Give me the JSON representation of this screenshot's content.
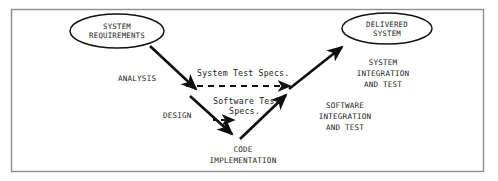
{
  "diagram": {
    "type": "v-model-process-diagram",
    "frame_color": "#8d8d8d",
    "line_color": "#0d0d0d",
    "background": "#ffffff",
    "nodes": [
      {
        "id": "system-requirements",
        "shape": "ellipse",
        "line1": "SYSTEM",
        "line2": "REQUIREMENTS"
      },
      {
        "id": "delivered-system",
        "shape": "ellipse",
        "line1": "DELIVERED",
        "line2": "SYSTEM"
      }
    ],
    "phases": [
      {
        "id": "analysis",
        "label": "ANALYSIS"
      },
      {
        "id": "design",
        "label": "DESIGN"
      }
    ],
    "stages": [
      {
        "id": "system-integration-and-test",
        "line1": "SYSTEM",
        "line2": "INTEGRATION",
        "line3": "AND TEST"
      },
      {
        "id": "software-integration-and-test",
        "line1": "SOFTWARE",
        "line2": "INTEGRATION",
        "line3": "AND TEST"
      },
      {
        "id": "code-implementation",
        "line1": "CODE",
        "line2": "IMPLEMENTATION"
      }
    ],
    "specs": [
      {
        "id": "system-test-specs",
        "label": "System Test Specs.",
        "arrow_style": "dashed",
        "direction": "left-to-right"
      },
      {
        "id": "software-test-specs",
        "line1": "Software Test",
        "line2": "Specs.",
        "arrow_style": "dashed",
        "direction": "left-to-right"
      }
    ]
  }
}
